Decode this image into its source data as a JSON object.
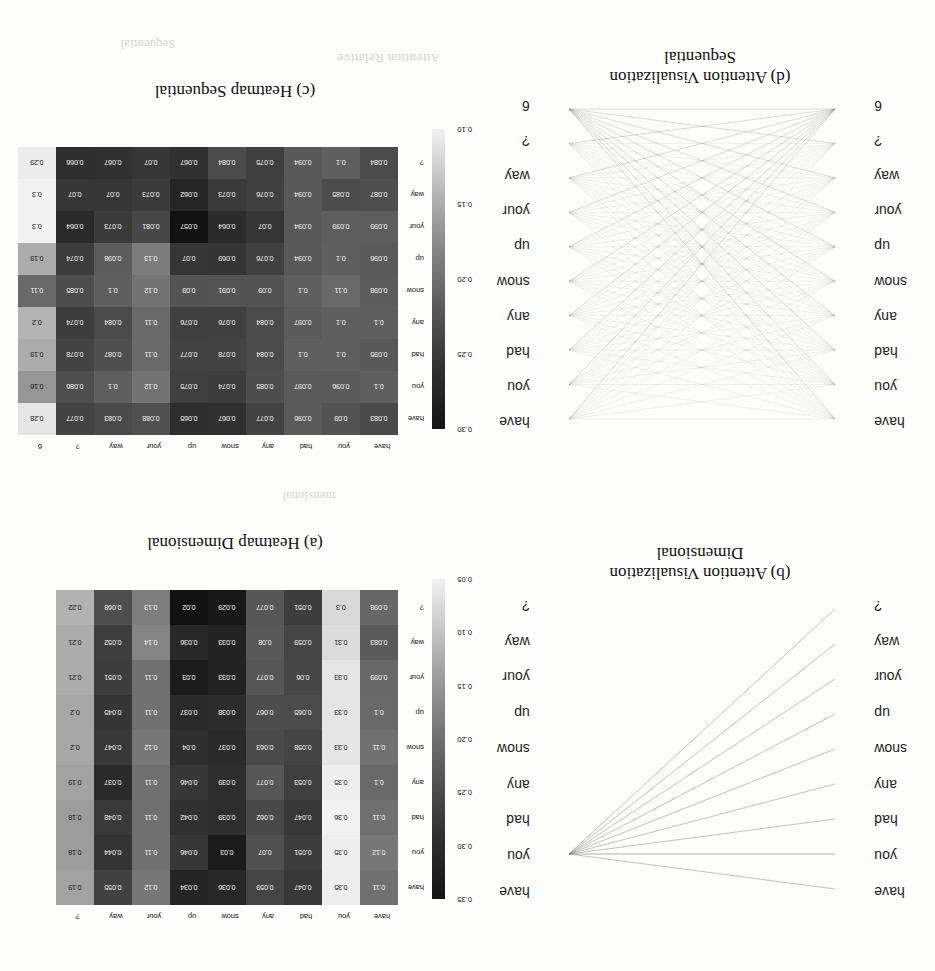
{
  "figure": {
    "orientation": "rotated-180",
    "tokens_10": [
      "have",
      "you",
      "had",
      "any",
      "snow",
      "up",
      "your",
      "way",
      "?",
      "6"
    ],
    "tokens_9": [
      "have",
      "you",
      "had",
      "any",
      "snow",
      "up",
      "your",
      "way",
      "?"
    ]
  },
  "panels": {
    "a": {
      "caption": "(a) Heatmap Dimensional",
      "type": "heatmap",
      "colorbar": {
        "ticks": [
          "0.05",
          "0.10",
          "0.15",
          "0.20",
          "0.25",
          "0.30",
          "0.35"
        ],
        "min": 0.05,
        "max": 0.35
      }
    },
    "b": {
      "caption_line1": "(b) Attention Visualization",
      "caption_line2": "Dimensional",
      "type": "attention-lines"
    },
    "c": {
      "caption": "(c) Heatmap Sequential",
      "type": "heatmap",
      "colorbar": {
        "ticks": [
          "0.10",
          "0.15",
          "0.20",
          "0.25",
          "0.30"
        ],
        "min": 0.1,
        "max": 0.3
      }
    },
    "d": {
      "caption_line1": "(d) Attention Visualization",
      "caption_line2": "Sequential",
      "type": "attention-lines"
    }
  },
  "chart_data": [
    {
      "id": "heatmap-a",
      "type": "heatmap",
      "title": "(a) Heatmap Dimensional",
      "xlabel": "",
      "ylabel": "",
      "legend_position": "left",
      "grid": false,
      "colorbar_label": "",
      "colorbar_ticks": [
        0.05,
        0.1,
        0.15,
        0.2,
        0.25,
        0.3,
        0.35
      ],
      "vmin": 0.028,
      "vmax": 0.36,
      "x": [
        "have",
        "you",
        "had",
        "any",
        "snow",
        "up",
        "your",
        "way",
        "?"
      ],
      "y": [
        "have",
        "you",
        "had",
        "any",
        "snow",
        "up",
        "your",
        "way",
        "?"
      ],
      "values": [
        [
          0.11,
          0.35,
          0.047,
          0.059,
          0.036,
          0.034,
          0.12,
          0.055,
          0.19
        ],
        [
          0.12,
          0.35,
          0.051,
          0.07,
          0.03,
          0.046,
          0.11,
          0.044,
          0.18
        ],
        [
          0.11,
          0.36,
          0.047,
          0.062,
          0.039,
          0.042,
          0.11,
          0.048,
          0.18
        ],
        [
          0.1,
          0.35,
          0.053,
          0.077,
          0.039,
          0.046,
          0.11,
          0.037,
          0.19
        ],
        [
          0.11,
          0.33,
          0.058,
          0.063,
          0.037,
          0.04,
          0.12,
          0.047,
          0.2
        ],
        [
          0.1,
          0.33,
          0.065,
          0.067,
          0.038,
          0.037,
          0.11,
          0.045,
          0.2
        ],
        [
          0.099,
          0.33,
          0.06,
          0.077,
          0.033,
          0.03,
          0.11,
          0.051,
          0.21
        ],
        [
          0.083,
          0.31,
          0.059,
          0.08,
          0.033,
          0.036,
          0.14,
          0.052,
          0.21
        ],
        [
          0.098,
          0.3,
          0.051,
          0.077,
          0.029,
          0.02,
          0.13,
          0.068,
          0.22
        ]
      ]
    },
    {
      "id": "heatmap-c",
      "type": "heatmap",
      "title": "(c) Heatmap Sequential",
      "xlabel": "",
      "ylabel": "",
      "legend_position": "left",
      "grid": false,
      "colorbar_label": "",
      "colorbar_ticks": [
        0.1,
        0.15,
        0.2,
        0.25,
        0.3
      ],
      "vmin": 0.057,
      "vmax": 0.3,
      "x": [
        "have",
        "you",
        "had",
        "any",
        "snow",
        "up",
        "your",
        "way",
        "?",
        "6"
      ],
      "y": [
        "have",
        "you",
        "had",
        "any",
        "snow",
        "up",
        "your",
        "way",
        "?"
      ],
      "values": [
        [
          0.083,
          0.09,
          0.096,
          0.077,
          0.067,
          0.065,
          0.088,
          0.083,
          0.077,
          0.28
        ],
        [
          0.1,
          0.096,
          0.097,
          0.085,
          0.074,
          0.075,
          0.12,
          0.1,
          0.086,
          0.16
        ],
        [
          0.095,
          0.1,
          0.1,
          0.084,
          0.078,
          0.077,
          0.11,
          0.087,
          0.078,
          0.19
        ],
        [
          0.1,
          0.1,
          0.097,
          0.084,
          0.076,
          0.076,
          0.11,
          0.084,
          0.074,
          0.2
        ],
        [
          0.098,
          0.11,
          0.1,
          0.09,
          0.091,
          0.09,
          0.12,
          0.1,
          0.085,
          0.11
        ],
        [
          0.096,
          0.1,
          0.094,
          0.076,
          0.069,
          0.07,
          0.13,
          0.098,
          0.074,
          0.19
        ],
        [
          0.099,
          0.099,
          0.094,
          0.07,
          0.064,
          0.057,
          0.081,
          0.073,
          0.064,
          0.3
        ],
        [
          0.087,
          0.085,
          0.094,
          0.076,
          0.073,
          0.062,
          0.073,
          0.07,
          0.07,
          0.3
        ],
        [
          0.084,
          0.1,
          0.094,
          0.075,
          0.084,
          0.067,
          0.07,
          0.067,
          0.066,
          0.29
        ]
      ]
    },
    {
      "id": "viz-b",
      "type": "attention-lines",
      "title": "(b) Attention Visualization Dimensional",
      "left_tokens": [
        "have",
        "you",
        "had",
        "any",
        "snow",
        "up",
        "your",
        "way",
        "?"
      ],
      "right_tokens": [
        "have",
        "you",
        "had",
        "any",
        "snow",
        "up",
        "your",
        "way",
        "?"
      ],
      "note": "Edges strongly concentrated onto the token 'you'."
    },
    {
      "id": "viz-d",
      "type": "attention-lines",
      "title": "(d) Attention Visualization Sequential",
      "left_tokens": [
        "have",
        "you",
        "had",
        "any",
        "snow",
        "up",
        "your",
        "way",
        "?",
        "6"
      ],
      "right_tokens": [
        "have",
        "you",
        "had",
        "any",
        "snow",
        "up",
        "your",
        "way",
        "?",
        "6"
      ],
      "note": "Dense near-uniform edges; strongest fan from token '6'."
    }
  ],
  "ghost_text": [
    {
      "t": "Attention      Relative",
      "x": 495,
      "y": 905,
      "size": 13
    },
    {
      "t": "mensional",
      "x": 600,
      "y": 468,
      "size": 12
    },
    {
      "t": "Sequential",
      "x": 760,
      "y": 920,
      "size": 12
    }
  ]
}
